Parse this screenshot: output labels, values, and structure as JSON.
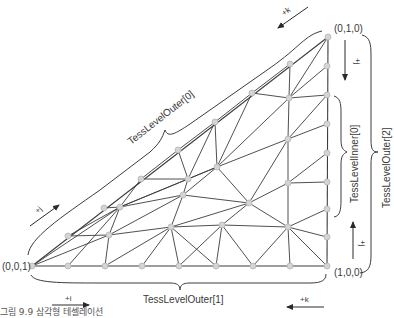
{
  "diagram": {
    "corners": {
      "top": "(0,1,0)",
      "left": "(0,0,1)",
      "right": "(1,0,0)"
    },
    "labels": {
      "outer0": "TessLevelOuter[0]",
      "outer1": "TessLevelOuter[1]",
      "outer2": "TessLevelOuter[2]",
      "inner0": "TessLevelInner[0]"
    },
    "arrows": {
      "top_k": "+k",
      "left_j": "+j",
      "bottom_i": "+i",
      "bottom_k": "+k",
      "right_top_j": "+j",
      "right_bottom_j": "+j"
    },
    "colors": {
      "edge": "#3c3c3c",
      "vertex_fill": "#d4d4d4",
      "vertex_stroke": "#b5b5b5",
      "text": "#3a3a3a"
    }
  },
  "caption": "그림 9.9 삼각형 테셀레이션"
}
